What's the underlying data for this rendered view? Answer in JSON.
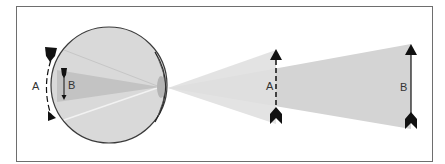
{
  "diagram": {
    "type": "optics-visual-angle",
    "labels": {
      "object_near": "A",
      "object_far": "B",
      "retina_image_large": "A",
      "retina_image_small": "B"
    },
    "colors": {
      "frame": "#6e6e6e",
      "eye_fill": "#d9d9d9",
      "eye_stroke": "#3a3a3a",
      "beam_light": "#dcdcdc",
      "beam_dark": "#c4c4c4",
      "lens": "#b5b5b5",
      "arrow": "#111111",
      "text": "#333333"
    }
  }
}
